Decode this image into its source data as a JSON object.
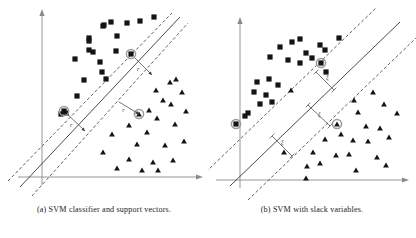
{
  "figure": {
    "panels": [
      {
        "id": "panel-a",
        "caption": "(a) SVM classifier and support vectors.",
        "axes": {
          "x_label": "",
          "y_label": "",
          "color": "#8a8a8a"
        },
        "lines": {
          "decision_boundary": {
            "x1": 22,
            "y1": 180,
            "x2": 173,
            "y2": 16,
            "style": "solid",
            "color": "#2b2b2b"
          },
          "margin_upper": {
            "x1": 10,
            "y1": 180,
            "x2": 168,
            "y2": 14,
            "style": "dashed",
            "color": "#2b2b2b"
          },
          "margin_lower": {
            "x1": 30,
            "y1": 190,
            "x2": 180,
            "y2": 22,
            "style": "dashed",
            "color": "#2b2b2b"
          }
        },
        "margin_annotations": [
          {
            "name": "margin-upper-right",
            "label": "r",
            "from_x": 131,
            "from_y": 54,
            "to_x": 152,
            "to_y": 75
          },
          {
            "name": "margin-center",
            "label": "r",
            "from_x": 114,
            "from_y": 99,
            "to_x": 139,
            "to_y": 114
          },
          {
            "name": "margin-lower-left",
            "label": "r",
            "from_x": 64,
            "from_y": 111,
            "to_x": 85,
            "to_y": 131
          }
        ],
        "support_vectors": [
          {
            "name": "sv-square-upper",
            "shape": "square",
            "x": 131,
            "y": 54
          },
          {
            "name": "sv-square-lower",
            "shape": "square",
            "x": 64,
            "y": 111
          },
          {
            "name": "sv-triangle-center",
            "shape": "triangle",
            "x": 139,
            "y": 114
          }
        ],
        "squares": [
          [
            103,
            26
          ],
          [
            111,
            22
          ],
          [
            127,
            23
          ],
          [
            140,
            21
          ],
          [
            154,
            17
          ],
          [
            104,
            25
          ],
          [
            89,
            38
          ],
          [
            117,
            36
          ],
          [
            93,
            52
          ],
          [
            89,
            50
          ],
          [
            116,
            51
          ],
          [
            131,
            54
          ],
          [
            75,
            59
          ],
          [
            100,
            62
          ],
          [
            102,
            72
          ],
          [
            106,
            79
          ],
          [
            84,
            80
          ],
          [
            77,
            96
          ],
          [
            64,
            111
          ],
          [
            61,
            114
          ],
          [
            66,
            113
          ],
          [
            89,
            41
          ]
        ],
        "triangles": [
          [
            170,
            82
          ],
          [
            176,
            79
          ],
          [
            156,
            90
          ],
          [
            182,
            92
          ],
          [
            163,
            100
          ],
          [
            149,
            110
          ],
          [
            139,
            114
          ],
          [
            171,
            104
          ],
          [
            186,
            111
          ],
          [
            157,
            118
          ],
          [
            129,
            125
          ],
          [
            175,
            124
          ],
          [
            147,
            132
          ],
          [
            112,
            134
          ],
          [
            137,
            144
          ],
          [
            165,
            145
          ],
          [
            184,
            141
          ],
          [
            103,
            152
          ],
          [
            129,
            159
          ],
          [
            153,
            162
          ],
          [
            117,
            168
          ],
          [
            142,
            170
          ],
          [
            158,
            170
          ],
          [
            173,
            160
          ]
        ]
      },
      {
        "id": "panel-b",
        "caption": "(b) SVM with slack variables.",
        "axes": {
          "x_label": "",
          "y_label": "",
          "color": "#8a8a8a"
        },
        "lines": {
          "decision_boundary": {
            "x1": 22,
            "y1": 182,
            "x2": 186,
            "y2": 28,
            "style": "solid",
            "color": "#2b2b2b"
          },
          "margin_upper": {
            "x1": 0,
            "y1": 170,
            "x2": 166,
            "y2": 12,
            "style": "dashed",
            "color": "#2b2b2b"
          },
          "margin_lower": {
            "x1": 38,
            "y1": 196,
            "x2": 200,
            "y2": 42,
            "style": "dashed",
            "color": "#2b2b2b"
          }
        },
        "slack_annotations": [
          {
            "name": "slack-xi-1",
            "label": "ξ",
            "x": 118,
            "y": 79
          },
          {
            "name": "slack-xi-2",
            "label": "ξ",
            "x": 110,
            "y": 116
          },
          {
            "name": "slack-xi-3",
            "label": "ξ",
            "x": 73,
            "y": 144
          }
        ],
        "support_vectors": [
          {
            "name": "sv-square-margin",
            "shape": "square",
            "x": 113,
            "y": 63
          },
          {
            "name": "sv-triangle-violator",
            "shape": "triangle",
            "x": 129,
            "y": 124
          },
          {
            "name": "sv-square-left",
            "shape": "square",
            "x": 28,
            "y": 124
          }
        ],
        "squares": [
          [
            84,
            42
          ],
          [
            92,
            39
          ],
          [
            72,
            47
          ],
          [
            112,
            45
          ],
          [
            117,
            50
          ],
          [
            131,
            38
          ],
          [
            98,
            53
          ],
          [
            62,
            57
          ],
          [
            80,
            60
          ],
          [
            92,
            63
          ],
          [
            104,
            58
          ],
          [
            113,
            63
          ],
          [
            118,
            72
          ],
          [
            49,
            82
          ],
          [
            61,
            79
          ],
          [
            70,
            85
          ],
          [
            46,
            92
          ],
          [
            58,
            95
          ],
          [
            52,
            104
          ],
          [
            64,
            102
          ],
          [
            28,
            124
          ],
          [
            40,
            113
          ],
          [
            37,
            116
          ]
        ],
        "triangles": [
          [
            83,
            90
          ],
          [
            129,
            124
          ],
          [
            146,
            100
          ],
          [
            165,
            92
          ],
          [
            176,
            104
          ],
          [
            150,
            112
          ],
          [
            189,
            113
          ],
          [
            158,
            126
          ],
          [
            172,
            128
          ],
          [
            133,
            134
          ],
          [
            117,
            139
          ],
          [
            145,
            140
          ],
          [
            160,
            141
          ],
          [
            181,
            137
          ],
          [
            105,
            152
          ],
          [
            128,
            155
          ],
          [
            141,
            154
          ],
          [
            169,
            157
          ],
          [
            99,
            166
          ],
          [
            112,
            163
          ],
          [
            148,
            170
          ],
          [
            178,
            165
          ],
          [
            98,
            178
          ],
          [
            76,
            152
          ]
        ]
      }
    ]
  }
}
